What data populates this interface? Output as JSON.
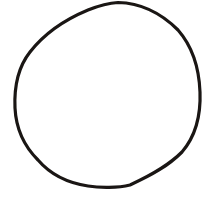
{
  "drawing": {
    "shape": "hand-drawn circle",
    "stroke_color": "#1a1614",
    "stroke_width": 3.2,
    "fill": "none",
    "background": "#ffffff",
    "path": "M118,2.5 C140,3 160,12 178,30 C192,46 199,66 200,92 C201,118 194,138 182,152 C168,166 152,175 130,185 C118,188 100,188 88,186 C68,183 50,174 38,160 C24,146 16,128 15,108 C14,86 19,66 30,52 C44,34 64,20 88,10 C98,6 108,3 118,2.5 Z"
  }
}
